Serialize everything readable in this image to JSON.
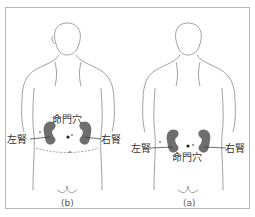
{
  "figures": [
    {
      "id": "b",
      "caption": "(b)",
      "labels": {
        "acupoint": "命門穴",
        "left_kidney": "左腎",
        "right_kidney": "右腎"
      }
    },
    {
      "id": "a",
      "caption": "(a)",
      "labels": {
        "acupoint": "命門穴",
        "left_kidney": "左腎",
        "right_kidney": "右腎"
      }
    }
  ],
  "colors": {
    "kidney": "#6e6e6e",
    "outline": "#8a8a8a",
    "frame": "#b5b5b5",
    "text": "#333333"
  }
}
